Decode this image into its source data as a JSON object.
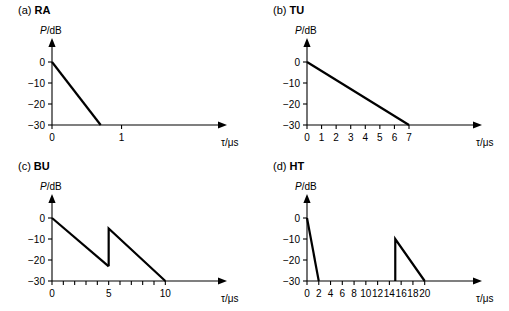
{
  "figure": {
    "background": "#ffffff",
    "line_color": "#000000"
  },
  "axis_labels": {
    "y": "P/dB",
    "y_symbol": "P",
    "y_rest": "/dB",
    "x": "τ/μs",
    "x_symbol": "τ",
    "x_rest": "/μs"
  },
  "panels": {
    "a": {
      "tag": "(a)",
      "name": "RA",
      "title": "(a) RA"
    },
    "b": {
      "tag": "(b)",
      "name": "TU",
      "title": "(b) TU"
    },
    "c": {
      "tag": "(c)",
      "name": "BU",
      "title": "(c) BU"
    },
    "d": {
      "tag": "(d)",
      "name": "HT",
      "title": "(d) HT"
    }
  },
  "chart_data": [
    {
      "id": "a",
      "type": "line",
      "title": "(a) RA",
      "xlabel": "τ/μs",
      "ylabel": "P/dB",
      "xlim": [
        0,
        2.2
      ],
      "ylim": [
        -30,
        2
      ],
      "grid": false,
      "legend": "none",
      "yticks": [
        0,
        -10,
        -20,
        -30
      ],
      "ytick_labels": [
        "0",
        "−10",
        "−20",
        "−30"
      ],
      "xticks": [
        0,
        1
      ],
      "xtick_labels": [
        "0",
        "1"
      ],
      "xticks_unlabeled": [],
      "series": [
        {
          "name": "RA power delay profile",
          "x": [
            0,
            0.7
          ],
          "y": [
            0,
            -30
          ]
        }
      ]
    },
    {
      "id": "b",
      "type": "line",
      "title": "(b) TU",
      "xlabel": "τ/μs",
      "ylabel": "P/dB",
      "xlim": [
        0,
        10.5
      ],
      "ylim": [
        -30,
        2
      ],
      "grid": false,
      "legend": "none",
      "yticks": [
        0,
        -10,
        -20,
        -30
      ],
      "ytick_labels": [
        "0",
        "−10",
        "−20",
        "−30"
      ],
      "xticks": [
        0,
        1,
        2,
        3,
        4,
        5,
        6,
        7
      ],
      "xtick_labels": [
        "0",
        "1",
        "2",
        "3",
        "4",
        "5",
        "6",
        "7"
      ],
      "xticks_unlabeled": [],
      "series": [
        {
          "name": "TU power delay profile",
          "x": [
            0,
            7
          ],
          "y": [
            0,
            -30
          ]
        }
      ]
    },
    {
      "id": "c",
      "type": "line",
      "title": "(c) BU",
      "xlabel": "τ/μs",
      "ylabel": "P/dB",
      "xlim": [
        0,
        13.5
      ],
      "ylim": [
        -30,
        2
      ],
      "grid": false,
      "legend": "none",
      "yticks": [
        0,
        -10,
        -20,
        -30
      ],
      "ytick_labels": [
        "0",
        "−10",
        "−20",
        "−30"
      ],
      "xticks": [
        0,
        5,
        10
      ],
      "xtick_labels": [
        "0",
        "5",
        "10"
      ],
      "xticks_unlabeled": [
        1,
        2,
        3,
        4,
        6,
        7,
        8,
        9
      ],
      "series": [
        {
          "name": "BU first cluster",
          "x": [
            0,
            5
          ],
          "y": [
            0,
            -23
          ]
        },
        {
          "name": "BU second cluster",
          "x": [
            5,
            5,
            10
          ],
          "y": [
            -23,
            -5,
            -30
          ]
        }
      ]
    },
    {
      "id": "d",
      "type": "line",
      "title": "(d) HT",
      "xlabel": "τ/μs",
      "ylabel": "P/dB",
      "xlim": [
        0,
        26
      ],
      "ylim": [
        -30,
        2
      ],
      "grid": false,
      "legend": "none",
      "yticks": [
        0,
        -10,
        -20,
        -30
      ],
      "ytick_labels": [
        "0",
        "−10",
        "−20",
        "−30"
      ],
      "xticks": [
        0,
        2,
        4,
        6,
        8,
        10,
        12,
        14,
        16,
        18,
        20
      ],
      "xtick_labels": [
        "0",
        "2",
        "4",
        "6",
        "8",
        "10",
        "12",
        "14",
        "16",
        "18",
        "20"
      ],
      "xticks_unlabeled": [],
      "series": [
        {
          "name": "HT first cluster",
          "x": [
            0,
            2
          ],
          "y": [
            0,
            -30
          ]
        },
        {
          "name": "HT second cluster",
          "x": [
            15,
            15,
            20
          ],
          "y": [
            -30,
            -10,
            -30
          ]
        }
      ]
    }
  ]
}
